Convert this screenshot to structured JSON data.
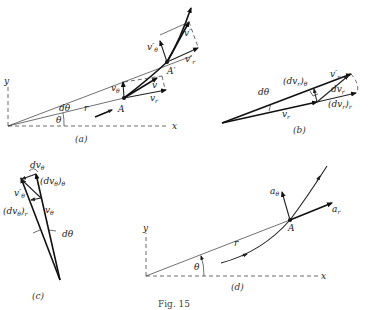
{
  "figure": {
    "caption": "Fig. 15",
    "panels": {
      "a": {
        "label": "(a)",
        "axis_x": "x",
        "axis_y": "y",
        "r": "r",
        "theta": "θ",
        "dtheta": "dθ",
        "point_A": "A",
        "point_A_prime": "A′",
        "v": "v",
        "v_r": "v",
        "v_r_sub": "r",
        "v_theta": "v",
        "v_theta_sub": "θ",
        "v_prime": "v′",
        "v_r_prime": "v′",
        "v_r_prime_sub": "r",
        "v_theta_prime": "v′",
        "v_theta_prime_sub": "θ"
      },
      "b": {
        "label": "(b)",
        "dtheta": "dθ",
        "v_r": "v",
        "v_r_sub": "r",
        "v_r_prime": "v′",
        "v_r_prime_sub": "r",
        "dv_r": "dv",
        "dv_r_sub": "r",
        "dv_r_theta": "(dv",
        "dv_r_theta_sub1": "r",
        "dv_r_theta_close": ")",
        "dv_r_theta_sub2": "θ",
        "dv_r_r": "(dv",
        "dv_r_r_sub1": "r",
        "dv_r_r_close": ")",
        "dv_r_r_sub2": "r"
      },
      "c": {
        "label": "(c)",
        "dtheta": "dθ",
        "v_theta": "v",
        "v_theta_sub": "θ",
        "v_theta_prime": "v′",
        "v_theta_prime_sub": "θ",
        "dv_theta": "dv",
        "dv_theta_sub": "θ",
        "dv_theta_theta": "(dv",
        "dv_theta_theta_sub1": "θ",
        "dv_theta_theta_close": ")",
        "dv_theta_theta_sub2": "θ",
        "dv_theta_r": "(dv",
        "dv_theta_r_sub1": "θ",
        "dv_theta_r_close": ")",
        "dv_theta_r_sub2": "r"
      },
      "d": {
        "label": "(d)",
        "axis_x": "x",
        "axis_y": "y",
        "r": "r",
        "theta": "θ",
        "point_A": "A",
        "a_r": "a",
        "a_r_sub": "r",
        "a_theta": "a",
        "a_theta_sub": "θ"
      }
    }
  }
}
